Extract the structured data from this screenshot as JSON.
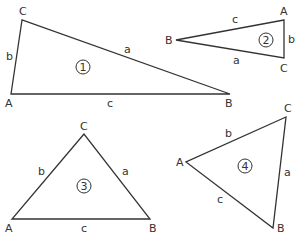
{
  "triangles": [
    {
      "id": "1",
      "vertices": {
        "A": "A",
        "B": "B",
        "C": "C"
      },
      "sides": {
        "a": "a",
        "b": "b",
        "c": "c"
      },
      "number": "1",
      "type": "obtuse"
    },
    {
      "id": "2",
      "vertices": {
        "A": "A",
        "B": "B",
        "C": "C"
      },
      "sides": {
        "a": "a",
        "b": "b",
        "c": "c"
      },
      "number": "2",
      "type": "obtuse"
    },
    {
      "id": "3",
      "vertices": {
        "A": "A",
        "B": "B",
        "C": "C"
      },
      "sides": {
        "a": "a",
        "b": "b",
        "c": "c"
      },
      "number": "3",
      "type": "acute"
    },
    {
      "id": "4",
      "vertices": {
        "A": "A",
        "B": "B",
        "C": "C"
      },
      "sides": {
        "a": "a",
        "b": "b",
        "c": "c"
      },
      "number": "4",
      "type": "acute"
    }
  ]
}
